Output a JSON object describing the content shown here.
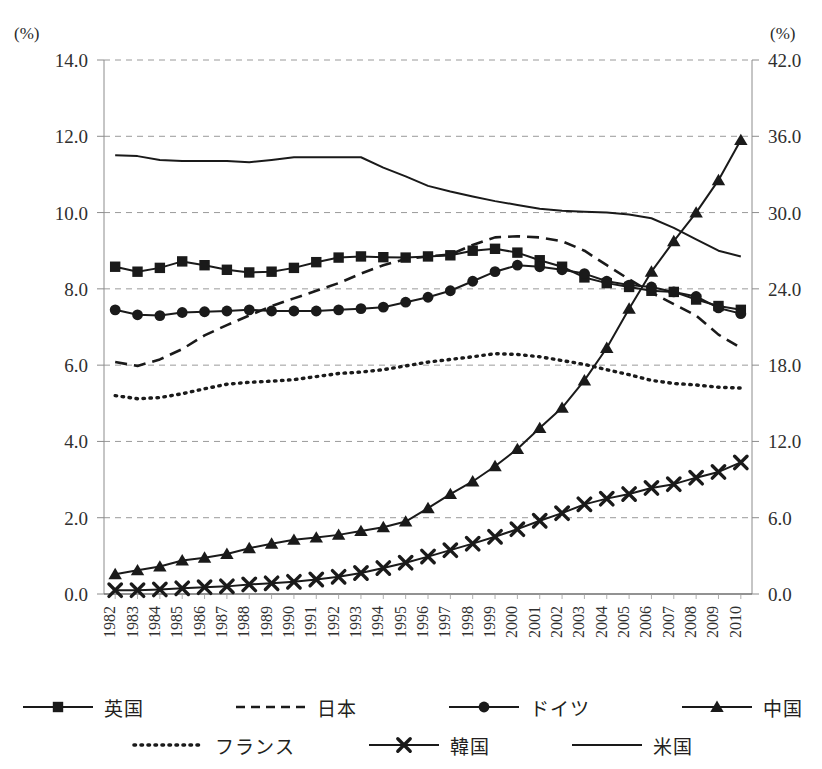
{
  "axes": {
    "left_unit": "(%)",
    "right_unit": "(%)",
    "left_ticks": [
      "0.0",
      "2.0",
      "4.0",
      "6.0",
      "8.0",
      "10.0",
      "12.0",
      "14.0"
    ],
    "right_ticks": [
      "0.0",
      "6.0",
      "12.0",
      "18.0",
      "24.0",
      "30.0",
      "36.0",
      "42.0"
    ]
  },
  "legend": {
    "rows": [
      [
        {
          "label": "英国",
          "marker": "square",
          "dash": "solid",
          "name": "legend-item-uk"
        },
        {
          "label": "日本",
          "marker": "none",
          "dash": "dashed",
          "name": "legend-item-japan"
        },
        {
          "label": "ドイツ",
          "marker": "circle",
          "dash": "solid",
          "name": "legend-item-germany"
        },
        {
          "label": "中国",
          "marker": "triangle",
          "dash": "solid",
          "name": "legend-item-china"
        }
      ],
      [
        {
          "label": "フランス",
          "marker": "none",
          "dash": "dotted",
          "name": "legend-item-france"
        },
        {
          "label": "韓国",
          "marker": "cross",
          "dash": "solid",
          "name": "legend-item-korea"
        },
        {
          "label": "米国",
          "marker": "none",
          "dash": "solid",
          "name": "legend-item-usa"
        }
      ]
    ]
  },
  "chart_data": {
    "type": "line",
    "title": "",
    "xlabel": "",
    "ylabel": "(%)",
    "y2label": "(%)",
    "ylim": [
      0.0,
      14.0
    ],
    "y2lim": [
      0.0,
      42.0
    ],
    "ytick_step": 2.0,
    "y2tick_step": 6.0,
    "grid": "horizontal-dashed",
    "legend_position": "bottom",
    "x": [
      1982,
      1983,
      1984,
      1985,
      1986,
      1987,
      1988,
      1989,
      1990,
      1991,
      1992,
      1993,
      1994,
      1995,
      1996,
      1997,
      1998,
      1999,
      2000,
      2001,
      2002,
      2003,
      2004,
      2005,
      2006,
      2007,
      2008,
      2009,
      2010
    ],
    "series": [
      {
        "name": "英国",
        "axis": "left",
        "marker": "square",
        "dash": "solid",
        "values": [
          8.58,
          8.45,
          8.55,
          8.72,
          8.62,
          8.5,
          8.43,
          8.45,
          8.55,
          8.7,
          8.82,
          8.85,
          8.83,
          8.82,
          8.85,
          8.88,
          9.0,
          9.05,
          8.95,
          8.75,
          8.58,
          8.3,
          8.15,
          8.05,
          7.95,
          7.92,
          7.72,
          7.55,
          7.45
        ]
      },
      {
        "name": "日本",
        "axis": "left",
        "marker": "none",
        "dash": "dashed",
        "values": [
          6.08,
          5.98,
          6.15,
          6.42,
          6.78,
          7.05,
          7.3,
          7.55,
          7.75,
          7.95,
          8.15,
          8.4,
          8.62,
          8.78,
          8.85,
          8.9,
          9.15,
          9.35,
          9.38,
          9.35,
          9.25,
          9.0,
          8.62,
          8.25,
          7.9,
          7.6,
          7.3,
          6.8,
          6.45
        ]
      },
      {
        "name": "ドイツ",
        "axis": "left",
        "marker": "circle",
        "dash": "solid",
        "values": [
          7.45,
          7.32,
          7.3,
          7.38,
          7.4,
          7.42,
          7.45,
          7.42,
          7.42,
          7.42,
          7.45,
          7.48,
          7.52,
          7.65,
          7.78,
          7.95,
          8.2,
          8.45,
          8.62,
          8.58,
          8.5,
          8.4,
          8.2,
          8.1,
          8.05,
          7.92,
          7.8,
          7.5,
          7.35
        ]
      },
      {
        "name": "中国",
        "axis": "left",
        "marker": "triangle",
        "dash": "solid",
        "values": [
          0.52,
          0.62,
          0.72,
          0.88,
          0.95,
          1.05,
          1.2,
          1.32,
          1.42,
          1.48,
          1.55,
          1.65,
          1.75,
          1.9,
          2.25,
          2.62,
          2.95,
          3.35,
          3.8,
          4.35,
          4.88,
          5.6,
          6.45,
          7.48,
          8.45,
          9.25,
          10.0,
          10.85,
          11.9
        ]
      },
      {
        "name": "フランス",
        "axis": "left",
        "marker": "none",
        "dash": "dotted",
        "values": [
          5.2,
          5.12,
          5.15,
          5.25,
          5.38,
          5.5,
          5.55,
          5.58,
          5.62,
          5.7,
          5.78,
          5.82,
          5.88,
          5.98,
          6.08,
          6.15,
          6.22,
          6.3,
          6.28,
          6.22,
          6.12,
          6.02,
          5.88,
          5.75,
          5.6,
          5.52,
          5.48,
          5.42,
          5.4
        ]
      },
      {
        "name": "韓国",
        "axis": "left",
        "marker": "cross",
        "dash": "solid",
        "values": [
          0.1,
          0.1,
          0.12,
          0.15,
          0.18,
          0.2,
          0.25,
          0.28,
          0.32,
          0.38,
          0.45,
          0.55,
          0.68,
          0.82,
          0.98,
          1.15,
          1.32,
          1.5,
          1.7,
          1.92,
          2.12,
          2.35,
          2.5,
          2.62,
          2.78,
          2.88,
          3.05,
          3.2,
          3.45
        ]
      },
      {
        "name": "米国",
        "axis": "left",
        "marker": "none",
        "dash": "solid",
        "values": [
          11.5,
          11.48,
          11.38,
          11.35,
          11.35,
          11.35,
          11.32,
          11.38,
          11.45,
          11.45,
          11.45,
          11.45,
          11.18,
          10.95,
          10.7,
          10.55,
          10.42,
          10.3,
          10.2,
          10.1,
          10.05,
          10.02,
          10.0,
          9.95,
          9.85,
          9.6,
          9.3,
          9.0,
          8.85
        ]
      }
    ]
  }
}
